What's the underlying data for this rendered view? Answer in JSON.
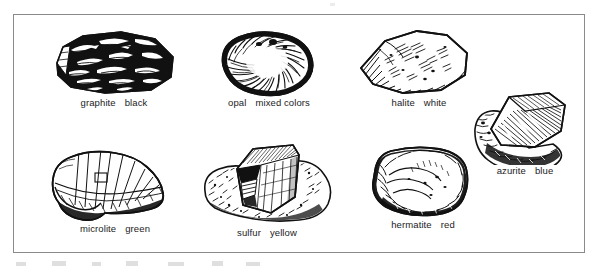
{
  "figure": {
    "kind": "mineral-specimen-plate",
    "border_color": "#8a8a8a",
    "background_color": "#ffffff",
    "ink_color": "#111111",
    "caption_color": "#1b1b1b",
    "rows": 2,
    "specimens_count": 7
  },
  "specimens": [
    {
      "id": "graphite",
      "name": "graphite",
      "color_word": "black",
      "icon": "graphite-rock-icon",
      "row": 1,
      "column": 1
    },
    {
      "id": "opal",
      "name": "opal",
      "color_word": "mixed colors",
      "icon": "opal-rock-icon",
      "row": 1,
      "column": 2
    },
    {
      "id": "halite",
      "name": "halite",
      "color_word": "white",
      "icon": "halite-rock-icon",
      "row": 1,
      "column": 3
    },
    {
      "id": "azurite",
      "name": "azurite",
      "color_word": "blue",
      "icon": "azurite-rock-icon",
      "row": 1,
      "column": 4
    },
    {
      "id": "microlite",
      "name": "microlite",
      "color_word": "green",
      "icon": "microlite-rock-icon",
      "row": 2,
      "column": 1
    },
    {
      "id": "sulfur",
      "name": "sulfur",
      "color_word": "yellow",
      "icon": "sulfur-rock-icon",
      "row": 2,
      "column": 2
    },
    {
      "id": "hermatite",
      "name": "hermatite",
      "color_word": "red",
      "icon": "hermatite-rock-icon",
      "row": 2,
      "column": 3
    }
  ]
}
